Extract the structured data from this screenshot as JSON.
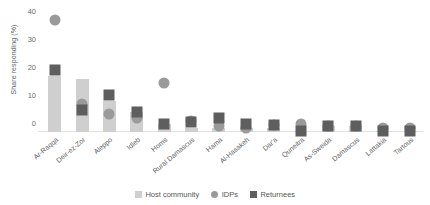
{
  "chart_data": {
    "type": "bar",
    "title": "",
    "subtitle": "",
    "xlabel": "",
    "ylabel": "Share responding (%)",
    "ylim": [
      0,
      42
    ],
    "yticks": [
      0,
      10,
      20,
      30,
      40
    ],
    "ytick_labels": [
      "0",
      "10",
      "20",
      "30",
      "40"
    ],
    "grid": false,
    "legend_position": "bottom-center",
    "categories": [
      "Ar-Raqqa",
      "Deir-ez-Zor",
      "Aleppo",
      "Idleb",
      "Homs",
      "Rural Damascus",
      "Hama",
      "Al-Hasakeh",
      "Dar'a",
      "Quneitra",
      "As-Sweida",
      "Damascus",
      "Lattakia",
      "Tartous"
    ],
    "series": [
      {
        "name": "Host community",
        "marker": "bar",
        "color": "#cfcfcf",
        "values": [
          20,
          19,
          11,
          7,
          3,
          1.5,
          1.5,
          1.5,
          1.5,
          0.5,
          2,
          2,
          0.3,
          0.3
        ]
      },
      {
        "name": "IDPs",
        "marker": "circle",
        "color": "#9a9a9a",
        "values": [
          40,
          10,
          6.5,
          5,
          17.5,
          4,
          2,
          1.5,
          2.5,
          3,
          2,
          2,
          1.5,
          1.5
        ]
      },
      {
        "name": "Returnees",
        "marker": "square",
        "color": "#5e5e5e",
        "values": [
          22,
          8,
          13,
          7,
          3,
          3.5,
          5,
          3,
          2.5,
          0.5,
          2,
          2,
          0.3,
          0.3
        ]
      }
    ]
  },
  "legend": {
    "items": [
      {
        "label": "Host community",
        "shape": "square",
        "color": "#cfcfcf"
      },
      {
        "label": "IDPs",
        "shape": "circle",
        "color": "#9a9a9a"
      },
      {
        "label": "Returnees",
        "shape": "square",
        "color": "#5e5e5e"
      }
    ]
  }
}
